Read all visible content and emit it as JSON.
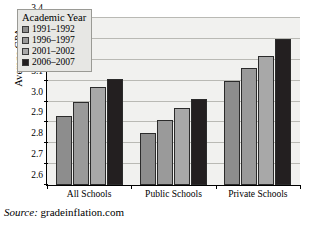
{
  "chart_data": {
    "type": "bar",
    "title": "",
    "xlabel": "",
    "ylabel": "Average GPA",
    "ylim": [
      2.6,
      3.4
    ],
    "ytick_step": 0.1,
    "yticks": [
      "3.4",
      "3.3",
      "3.2",
      "3.1",
      "3.0",
      "2.9",
      "2.8",
      "2.7",
      "2.6"
    ],
    "grid": true,
    "legend_position": "top-left",
    "legend_title": "Academic Year",
    "categories": [
      "All Schools",
      "Public Schools",
      "Private Schools"
    ],
    "series": [
      {
        "name": "1991–1992",
        "color": "#8d8d8d",
        "values": [
          2.93,
          2.85,
          3.1
        ]
      },
      {
        "name": "1996–1997",
        "color": "#9a9a9a",
        "values": [
          3.0,
          2.91,
          3.16
        ]
      },
      {
        "name": "2001–2002",
        "color": "#a8a8a8",
        "values": [
          3.07,
          2.97,
          3.22
        ]
      },
      {
        "name": "2006–2007",
        "color": "#231f20",
        "values": [
          3.11,
          3.01,
          3.3
        ]
      }
    ]
  },
  "source": {
    "label": "Source:",
    "value": "gradeinflation.com"
  },
  "colors": {
    "plot_background": "#f1f1ef",
    "legend_background": "#e7e7e4",
    "gridline": "#b9b9b4",
    "axis": "#000000"
  }
}
